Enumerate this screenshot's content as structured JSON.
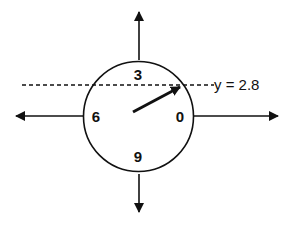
{
  "diagram": {
    "type": "unit-circle-dial",
    "dial_labels": {
      "right": "0",
      "top": "3",
      "left": "6",
      "bottom": "9"
    },
    "reference_line": {
      "label": "y = 2.8",
      "style": "dashed"
    },
    "axes": [
      "up-arrow",
      "down-arrow",
      "left-arrow",
      "right-arrow"
    ],
    "pointer": "arrow from center toward intersection of circle and dashed line",
    "colors": {
      "stroke": "#111111",
      "background": "#ffffff"
    }
  }
}
